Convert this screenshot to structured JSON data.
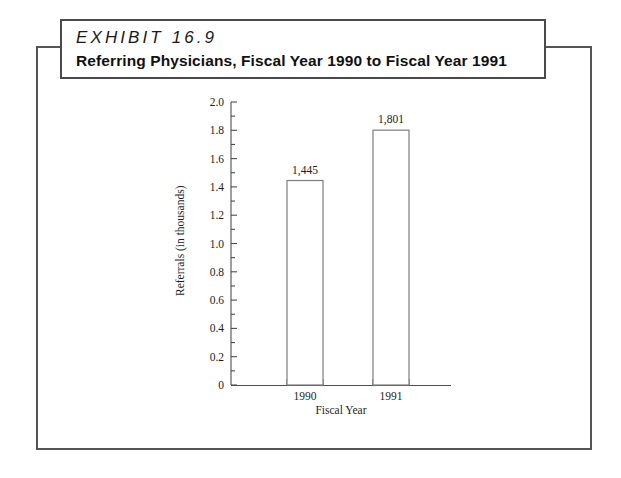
{
  "exhibit": {
    "number_label": "EXHIBIT 16.9",
    "subtitle": "Referring Physicians, Fiscal Year 1990 to Fiscal Year 1991"
  },
  "colors": {
    "frame_border": "#555555",
    "title_border": "#4a4a4a",
    "axis": "#4d4d4d",
    "bar_outline": "#7d7d7d",
    "bar_fill": "#ffffff",
    "text": "#1d1d1d",
    "background": "#ffffff"
  },
  "chart_data": {
    "type": "bar",
    "title": "Referring Physicians, Fiscal Year 1990 to Fiscal Year 1991",
    "categories": [
      "1990",
      "1991"
    ],
    "values": [
      1.445,
      1.801
    ],
    "data_labels": [
      "1,445",
      "1,801"
    ],
    "xlabel": "Fiscal Year",
    "ylabel": "Referrals (in thousands)",
    "ylim": [
      0,
      2.0
    ],
    "ytick_labels": [
      "0",
      "0.2",
      "0.4",
      "0.6",
      "0.8",
      "1.0",
      "1.2",
      "1.4",
      "1.6",
      "1.8",
      "2.0"
    ],
    "ytick_values": [
      0,
      0.2,
      0.4,
      0.6,
      0.8,
      1.0,
      1.2,
      1.4,
      1.6,
      1.8,
      2.0
    ],
    "minor_tick_step": 0.1,
    "grid": false,
    "legend": "none"
  }
}
